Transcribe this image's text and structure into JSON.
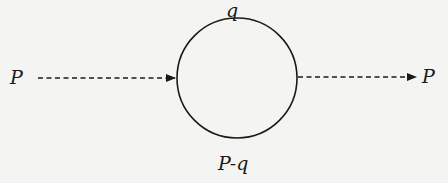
{
  "diagram": {
    "type": "feynman-loop",
    "colors": {
      "background": "#f4f4f3",
      "stroke": "#1a1a1a"
    },
    "loop": {
      "center_x": 237,
      "center_y": 78,
      "radius": 60
    },
    "labels": {
      "incoming": "P",
      "outgoing": "P",
      "top_propagator": "q",
      "bottom_propagator": "P-q"
    },
    "lines": [
      {
        "name": "incoming-line",
        "style": "dashed",
        "direction": "right",
        "from": "incoming",
        "to": "loop-left-vertex"
      },
      {
        "name": "outgoing-line",
        "style": "dashed",
        "direction": "right",
        "from": "loop-right-vertex",
        "to": "outgoing"
      }
    ]
  }
}
